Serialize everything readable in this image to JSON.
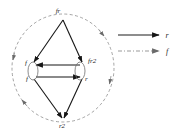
{
  "figure": {
    "background_color": "#ffffff",
    "nodes": [
      {
        "id": "top",
        "label": "fr",
        "x": 63,
        "y": 14
      },
      {
        "id": "left",
        "label": "f",
        "x": 28,
        "y": 64
      },
      {
        "id": "right",
        "label": "fr2",
        "x": 86,
        "y": 62
      },
      {
        "id": "midleft",
        "label": "f",
        "x": 29,
        "y": 80
      },
      {
        "id": "midright",
        "label": "r",
        "x": 86,
        "y": 80
      },
      {
        "id": "bottom",
        "label": "r2",
        "x": 63,
        "y": 123
      }
    ],
    "edges": [
      {
        "from": "top",
        "to": "left",
        "style": "solid",
        "direction": "down-left"
      },
      {
        "from": "top",
        "to": "right",
        "style": "solid",
        "direction": "down-right"
      },
      {
        "from": "right",
        "to": "left",
        "style": "solid",
        "direction": "left"
      },
      {
        "from": "midleft",
        "to": "midright",
        "style": "solid",
        "direction": "right"
      },
      {
        "from": "midleft",
        "to": "bottom",
        "style": "solid",
        "direction": "down-right"
      },
      {
        "from": "midright",
        "to": "bottom",
        "style": "solid",
        "direction": "down-left"
      }
    ],
    "orbit": {
      "shape": "circle",
      "style": "dashed",
      "color": "#8d8d8d",
      "center_x": 63,
      "center_y": 68,
      "radius_x": 51,
      "radius_y": 54
    },
    "self_loops": [
      {
        "at": "left-nodes",
        "shape": "ellipse",
        "cx": 33,
        "cy": 71,
        "rx": 5,
        "ry": 9
      },
      {
        "at": "right-nodes",
        "shape": "ellipse",
        "cx": 80,
        "cy": 71,
        "rx": 5,
        "ry": 9
      }
    ]
  },
  "legend": {
    "position": "right",
    "entries": [
      {
        "id": "entry-r",
        "label": "r",
        "line_style": "solid",
        "color": "#1c1c1c",
        "arrow": true
      },
      {
        "id": "entry-f",
        "label": "f",
        "line_style": "dashdot",
        "color": "#9a9a9a",
        "arrow": true
      }
    ]
  }
}
